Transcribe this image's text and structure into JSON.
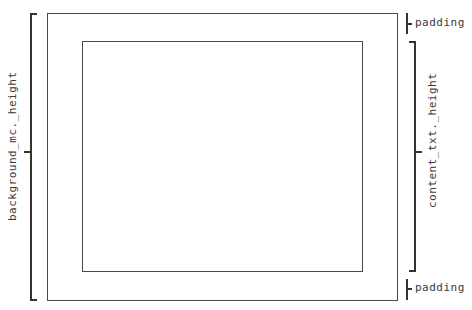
{
  "diagram": {
    "type": "box-model",
    "outer_box": {
      "name": "background_mc"
    },
    "inner_box": {
      "name": "content_txt"
    },
    "labels": {
      "left_height": "background_mc._height",
      "right_height": "content_txt._height",
      "padding_top": "padding",
      "padding_bottom": "padding"
    },
    "colors": {
      "stroke": "#4a4a4a",
      "text": "#3a3a3a",
      "background": "#ffffff"
    }
  }
}
